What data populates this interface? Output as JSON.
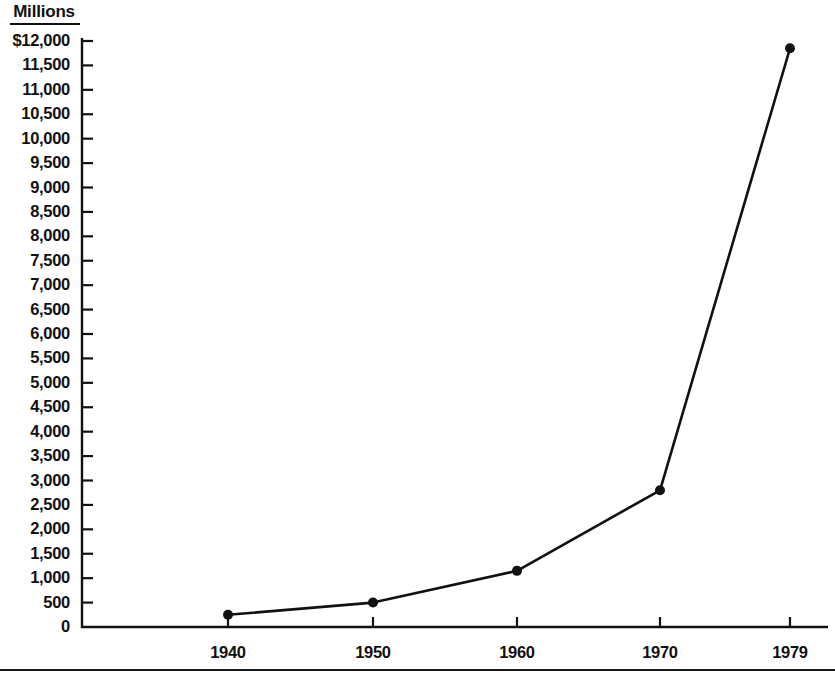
{
  "chart_data": {
    "type": "line",
    "title": "",
    "units_label": "Millions",
    "xlabel": "",
    "ylabel": "",
    "x": [
      "1940",
      "1950",
      "1960",
      "1970",
      "1979"
    ],
    "categories": [
      "1940",
      "1950",
      "1960",
      "1970",
      "1979"
    ],
    "values": [
      250,
      500,
      1150,
      2800,
      11850
    ],
    "series": [
      {
        "name": "Millions",
        "values": [
          250,
          500,
          1150,
          2800,
          11850
        ]
      }
    ],
    "ylim": [
      0,
      12000
    ],
    "ytick_step": 500,
    "ytick_labels": [
      "$12,000",
      "11,500",
      "11,000",
      "10,500",
      "10,000",
      "9,500",
      "9,000",
      "8,500",
      "8,000",
      "7,500",
      "7,000",
      "6,500",
      "6,000",
      "5,500",
      "5,000",
      "4,500",
      "4,000",
      "3,500",
      "3,000",
      "2,500",
      "2,000",
      "1,500",
      "1,000",
      "500",
      "0"
    ],
    "ytick_values": [
      12000,
      11500,
      11000,
      10500,
      10000,
      9500,
      9000,
      8500,
      8000,
      7500,
      7000,
      6500,
      6000,
      5500,
      5000,
      4500,
      4000,
      3500,
      3000,
      2500,
      2000,
      1500,
      1000,
      500,
      0
    ],
    "xtick_labels": [
      "1940",
      "1950",
      "1960",
      "1970",
      "1979"
    ],
    "grid": false,
    "legend": false,
    "marker": "filled-circle",
    "line_color": "#111111",
    "marker_color": "#111111",
    "background_color": "#ffffff"
  },
  "geometry": {
    "axis_x": 82,
    "axis_top_y": 38,
    "axis_bottom_y": 627,
    "axis_right_x": 828,
    "y_tick_top_y": 41,
    "y_tick_spacing": 24.42,
    "x_tick_positions": [
      228,
      373,
      517,
      660,
      790
    ],
    "point_pixels": [
      {
        "x": 228,
        "y": 617
      },
      {
        "x": 373,
        "y": 606
      },
      {
        "x": 517,
        "y": 571
      },
      {
        "x": 660,
        "y": 491
      },
      {
        "x": 790,
        "y": 47
      }
    ]
  }
}
